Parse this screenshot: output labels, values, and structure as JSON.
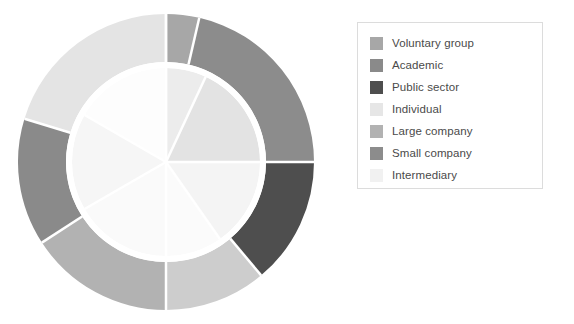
{
  "figure": {
    "background": "#ffffff",
    "width": 574,
    "height": 324
  },
  "legend": {
    "name": "chart-legend",
    "border_color": "#dcdcdc",
    "background": "#ffffff",
    "position": "right",
    "items": [
      {
        "label": "Voluntary group",
        "color": "#a7a7a7"
      },
      {
        "label": "Academic",
        "color": "#8a8a8a"
      },
      {
        "label": "Public sector",
        "color": "#4e4e4e"
      },
      {
        "label": "Individual",
        "color": "#e6e6e6"
      },
      {
        "label": "Large company",
        "color": "#b2b2b2"
      },
      {
        "label": "Small company",
        "color": "#8c8c8c"
      },
      {
        "label": "Intermediary",
        "color": "#f1f1f1"
      }
    ]
  },
  "chart_data": {
    "type": "pie",
    "title": "",
    "subtitle": "",
    "xlabel": "",
    "ylabel": "",
    "grid": false,
    "legend_position": "right",
    "variant": "nested-donut",
    "start_angle_deg": 0,
    "direction": "clockwise",
    "separator_color": "#ffffff",
    "separator_width_px": 2.5,
    "geometry": {
      "center_x": 158,
      "center_y": 160,
      "outer_radius": 148,
      "ring_inner_radius": 100,
      "inner_pie_radius": 94
    },
    "categories": [
      "Voluntary group",
      "Academic",
      "Public sector",
      "Individual",
      "Large company",
      "Small company",
      "Intermediary"
    ],
    "series": [
      {
        "name": "Outer ring",
        "ring": "outer",
        "slices": [
          {
            "category": "Voluntary group",
            "color": "#a7a7a7",
            "start_deg": 0,
            "end_deg": 13,
            "value": 3.6
          },
          {
            "category": "Small company",
            "color": "#8c8c8c",
            "start_deg": 13,
            "end_deg": 90,
            "value": 21.4
          },
          {
            "category": "Public sector",
            "color": "#4e4e4e",
            "start_deg": 90,
            "end_deg": 140,
            "value": 13.9
          },
          {
            "category": "Individual",
            "color": "#cdcdcd",
            "start_deg": 140,
            "end_deg": 180,
            "value": 11.1
          },
          {
            "category": "Large company",
            "color": "#b2b2b2",
            "start_deg": 180,
            "end_deg": 237,
            "value": 15.8
          },
          {
            "category": "Academic",
            "color": "#8a8a8a",
            "start_deg": 237,
            "end_deg": 287,
            "value": 13.9
          },
          {
            "category": "Intermediary",
            "color": "#e4e4e4",
            "start_deg": 287,
            "end_deg": 360,
            "value": 20.3
          }
        ]
      },
      {
        "name": "Inner pie",
        "ring": "inner",
        "slices": [
          {
            "category": "Voluntary group",
            "color": "#ececec",
            "start_deg": 0,
            "end_deg": 25,
            "value": 6.9
          },
          {
            "category": "Small company",
            "color": "#e3e3e3",
            "start_deg": 25,
            "end_deg": 90,
            "value": 18.1
          },
          {
            "category": "Public sector",
            "color": "#f4f4f4",
            "start_deg": 90,
            "end_deg": 145,
            "value": 15.3
          },
          {
            "category": "Individual",
            "color": "#fbfbfb",
            "start_deg": 145,
            "end_deg": 180,
            "value": 9.7
          },
          {
            "category": "Large company",
            "color": "#fafafa",
            "start_deg": 180,
            "end_deg": 240,
            "value": 16.7
          },
          {
            "category": "Academic",
            "color": "#f6f6f6",
            "start_deg": 240,
            "end_deg": 300,
            "value": 16.7
          },
          {
            "category": "Intermediary",
            "color": "#fdfdfd",
            "start_deg": 300,
            "end_deg": 360,
            "value": 16.6
          }
        ]
      }
    ]
  }
}
